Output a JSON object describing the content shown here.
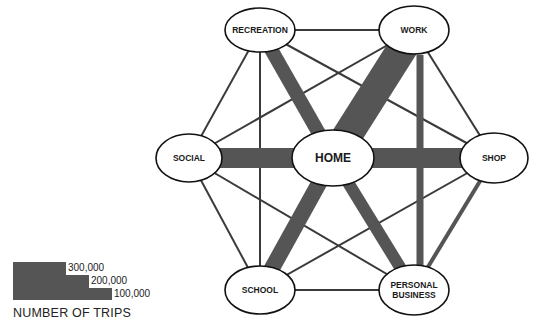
{
  "diagram": {
    "title": "",
    "nodes": [
      {
        "id": "recreation",
        "label": "RECREATION",
        "x": 260,
        "y": 30,
        "rx": 35,
        "ry": 22,
        "fs": 8.5
      },
      {
        "id": "work",
        "label": "WORK",
        "x": 414,
        "y": 30,
        "rx": 35,
        "ry": 24,
        "fs": 8.5
      },
      {
        "id": "social",
        "label": "SOCIAL",
        "x": 189,
        "y": 158,
        "rx": 33,
        "ry": 24,
        "fs": 8.5
      },
      {
        "id": "home",
        "label": "HOME",
        "x": 333,
        "y": 158,
        "rx": 41,
        "ry": 28,
        "fs": 12
      },
      {
        "id": "shop",
        "label": "SHOP",
        "x": 494,
        "y": 158,
        "rx": 34,
        "ry": 25,
        "fs": 8.5
      },
      {
        "id": "school",
        "label": "SCHOOL",
        "x": 260,
        "y": 290,
        "rx": 35,
        "ry": 24,
        "fs": 8.5
      },
      {
        "id": "personal_business",
        "label": "PERSONAL\nBUSINESS",
        "x": 414,
        "y": 290,
        "rx": 35,
        "ry": 25,
        "fs": 8.5
      }
    ],
    "flows": [
      {
        "from": "home",
        "to": "work",
        "width": 30,
        "level": "heavy"
      },
      {
        "from": "home",
        "to": "social",
        "width": 20,
        "level": "heavy"
      },
      {
        "from": "home",
        "to": "shop",
        "width": 20,
        "level": "heavy"
      },
      {
        "from": "home",
        "to": "school",
        "width": 16,
        "level": "heavy"
      },
      {
        "from": "home",
        "to": "recreation",
        "width": 14,
        "level": "heavy"
      },
      {
        "from": "home",
        "to": "personal_business",
        "width": 12,
        "level": "heavy"
      },
      {
        "from": "work",
        "to": "personal_business",
        "width": 7,
        "level": "medium",
        "via": [
          [
            420,
            55
          ],
          [
            420,
            266
          ]
        ]
      },
      {
        "from": "shop",
        "to": "personal_business",
        "width": 4,
        "level": "medium"
      },
      {
        "from": "recreation",
        "to": "work",
        "width": 2,
        "level": "light"
      },
      {
        "from": "recreation",
        "to": "social",
        "width": 2,
        "level": "light"
      },
      {
        "from": "recreation",
        "to": "shop",
        "width": 2,
        "level": "light"
      },
      {
        "from": "recreation",
        "to": "school",
        "width": 2,
        "level": "light"
      },
      {
        "from": "recreation",
        "to": "personal_business",
        "width": 2,
        "level": "light"
      },
      {
        "from": "work",
        "to": "social",
        "width": 2,
        "level": "light"
      },
      {
        "from": "work",
        "to": "shop",
        "width": 2,
        "level": "light"
      },
      {
        "from": "work",
        "to": "school",
        "width": 2,
        "level": "light"
      },
      {
        "from": "social",
        "to": "shop",
        "width": 2,
        "level": "light"
      },
      {
        "from": "social",
        "to": "school",
        "width": 2,
        "level": "light"
      },
      {
        "from": "social",
        "to": "personal_business",
        "width": 2,
        "level": "light"
      },
      {
        "from": "shop",
        "to": "school",
        "width": 2,
        "level": "light"
      },
      {
        "from": "school",
        "to": "personal_business",
        "width": 2,
        "level": "light"
      }
    ],
    "colors": {
      "band": "#555555",
      "line": "#3a3a3a",
      "node_fill": "#ffffff",
      "node_stroke": "#111111"
    }
  },
  "legend": {
    "title": "NUMBER OF TRIPS",
    "items": [
      {
        "label": "300,000"
      },
      {
        "label": "200,000"
      },
      {
        "label": "100,000"
      }
    ]
  }
}
